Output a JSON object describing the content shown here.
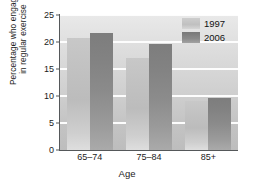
{
  "chart_data": {
    "type": "bar",
    "title": "",
    "categories": [
      "65–74",
      "75–84",
      "85+"
    ],
    "series": [
      {
        "name": "1997",
        "values": [
          20.7,
          17.0,
          9.0
        ],
        "color": "#c2c2c2"
      },
      {
        "name": "2006",
        "values": [
          21.7,
          19.6,
          9.6
        ],
        "color": "#878787"
      }
    ],
    "xlabel": "Age",
    "ylabel_line1": "Percentage who engage",
    "ylabel_line2": "in regular exercise",
    "ylim": [
      0,
      25
    ],
    "yticks": [
      0,
      5,
      10,
      15,
      20,
      25
    ],
    "ytick_labels": [
      "0",
      "5",
      "10",
      "15",
      "20",
      "25"
    ],
    "grid": "horizontal",
    "legend_position": "top-right",
    "legend_entries": [
      "1997",
      "2006"
    ]
  }
}
